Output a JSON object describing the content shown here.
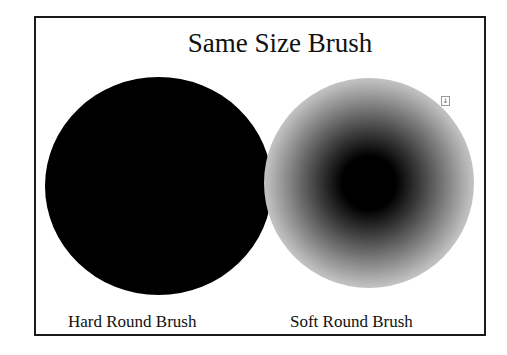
{
  "figure": {
    "title": "Same Size Brush",
    "brushes": [
      {
        "label": "Hard Round Brush",
        "type": "hard",
        "color": "#000000"
      },
      {
        "label": "Soft Round Brush",
        "type": "soft",
        "color": "#000000"
      }
    ],
    "marker_icon": "text-cursor-icon",
    "marker_glyph": "↓"
  }
}
